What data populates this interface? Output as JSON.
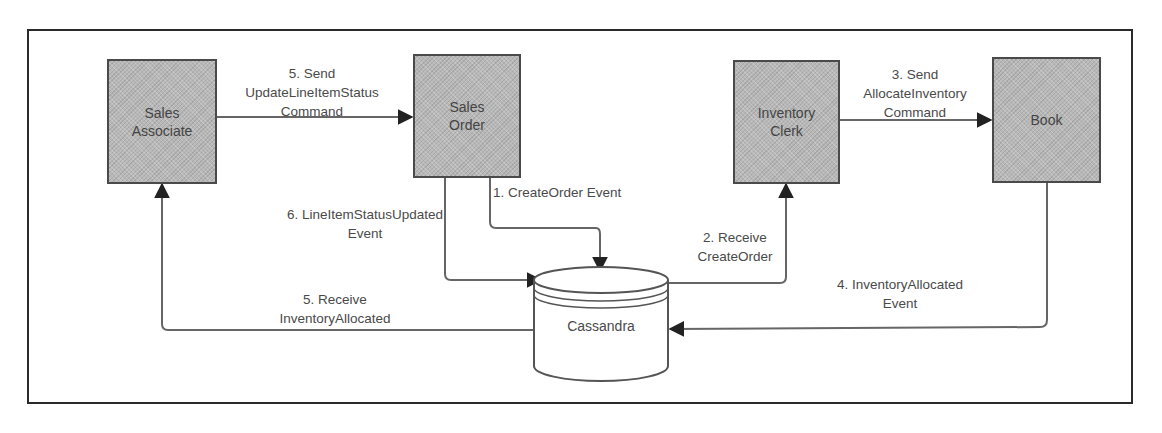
{
  "diagram": {
    "nodes": [
      {
        "id": "sales_associate",
        "label": "Sales\nAssociate",
        "shape": "rectangle"
      },
      {
        "id": "sales_order",
        "label": "Sales\nOrder",
        "shape": "rectangle"
      },
      {
        "id": "inventory_clerk",
        "label": "Inventory\nClerk",
        "shape": "rectangle"
      },
      {
        "id": "book",
        "label": "Book",
        "shape": "rectangle"
      },
      {
        "id": "cassandra",
        "label": "Cassandra",
        "shape": "cylinder"
      }
    ],
    "edges": [
      {
        "from": "sales_order",
        "to": "cassandra",
        "label": "1. CreateOrder Event"
      },
      {
        "from": "cassandra",
        "to": "inventory_clerk",
        "label": "2. Receive\nCreateOrder"
      },
      {
        "from": "inventory_clerk",
        "to": "book",
        "label": "3. Send\nAllocateInventory\nCommand"
      },
      {
        "from": "book",
        "to": "cassandra",
        "label": "4. InventoryAllocated\nEvent"
      },
      {
        "from": "cassandra",
        "to": "sales_associate",
        "label": "5. Receive\nInventoryAllocated"
      },
      {
        "from": "sales_associate",
        "to": "sales_order",
        "label": "5. Send\nUpdateLineItemStatus\nCommand"
      },
      {
        "from": "sales_order",
        "to": "cassandra",
        "label": "6. LineItemStatusUpdated\nEvent"
      }
    ]
  },
  "colors": {
    "node_fill": "#b8b8b8",
    "node_border": "#4a4a4a",
    "line": "#666666",
    "text": "#444444",
    "frame": "#2a2a2a"
  }
}
